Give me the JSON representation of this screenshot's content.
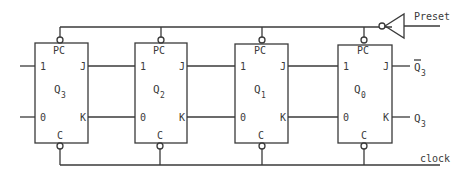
{
  "diagram": {
    "type": "shift-register-logic-diagram",
    "signals": {
      "preset": "Preset",
      "clock": "clock"
    },
    "flipflops": [
      {
        "name": "Q",
        "sub": "3",
        "pin_preset": "PC",
        "pin_clear": "C",
        "in_1": "1",
        "in_0": "0",
        "out_j": "J",
        "out_k": "K"
      },
      {
        "name": "Q",
        "sub": "2",
        "pin_preset": "PC",
        "pin_clear": "C",
        "in_1": "1",
        "in_0": "0",
        "out_j": "J",
        "out_k": "K"
      },
      {
        "name": "Q",
        "sub": "1",
        "pin_preset": "PC",
        "pin_clear": "C",
        "in_1": "1",
        "in_0": "0",
        "out_j": "J",
        "out_k": "K"
      },
      {
        "name": "Q",
        "sub": "0",
        "pin_preset": "PC",
        "pin_clear": "C",
        "in_1": "1",
        "in_0": "0",
        "out_j": "J",
        "out_k": "K"
      }
    ],
    "outputs": [
      {
        "name": "Q",
        "sub": "3",
        "overbar": true
      },
      {
        "name": "Q",
        "sub": "3",
        "overbar": false
      }
    ]
  }
}
